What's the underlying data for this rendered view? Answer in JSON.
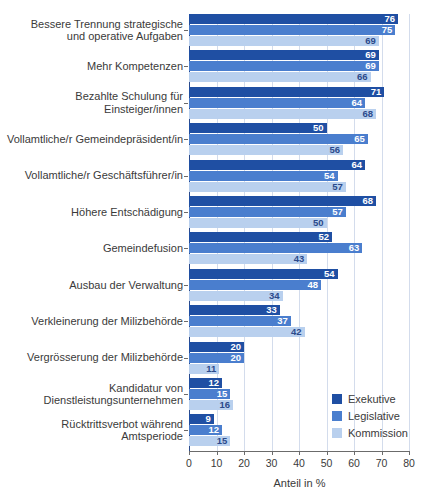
{
  "chart_data": {
    "type": "bar",
    "orientation": "horizontal",
    "title": "",
    "xlabel": "Anteil in %",
    "ylabel": "",
    "xlim": [
      0,
      80
    ],
    "xticks": [
      0,
      10,
      20,
      30,
      40,
      50,
      60,
      70,
      80
    ],
    "grid": true,
    "legend_position": "bottom-right",
    "categories": [
      "Bessere Trennung strategische und operative Aufgaben",
      "Mehr Kompetenzen",
      "Bezahlte Schulung für Einsteiger/innen",
      "Vollamtliche/r Gemeindepräsident/in",
      "Vollamtliche/r Geschäftsführer/in",
      "Höhere Entschädigung",
      "Gemeindefusion",
      "Ausbau der Verwaltung",
      "Verkleinerung der Milizbehörde",
      "Vergrösserung der Milizbehörde",
      "Kandidatur von Dienstleistungsunternehmen",
      "Rücktrittsverbot während Amtsperiode"
    ],
    "category_lines": [
      [
        "Bessere Trennung strategische",
        "und operative Aufgaben"
      ],
      [
        "Mehr Kompetenzen"
      ],
      [
        "Bezahlte Schulung für",
        "Einsteiger/innen"
      ],
      [
        "Vollamtliche/r Gemeindepräsident/in"
      ],
      [
        "Vollamtliche/r Geschäftsführer/in"
      ],
      [
        "Höhere Entschädigung"
      ],
      [
        "Gemeindefusion"
      ],
      [
        "Ausbau der Verwaltung"
      ],
      [
        "Verkleinerung der Milizbehörde"
      ],
      [
        "Vergrösserung der Milizbehörde"
      ],
      [
        "Kandidatur von",
        "Dienstleistungsunternehmen"
      ],
      [
        "Rücktrittsverbot während",
        "Amtsperiode"
      ]
    ],
    "series": [
      {
        "name": "Exekutive",
        "color": "#1f4fa3",
        "values": [
          76,
          69,
          71,
          50,
          64,
          68,
          52,
          54,
          33,
          20,
          12,
          9
        ]
      },
      {
        "name": "Legislative",
        "color": "#4a7ece",
        "values": [
          75,
          69,
          64,
          65,
          54,
          57,
          63,
          48,
          37,
          20,
          15,
          12
        ]
      },
      {
        "name": "Kommission",
        "color": "#b9d0ee",
        "values": [
          69,
          66,
          68,
          56,
          57,
          50,
          43,
          34,
          42,
          11,
          16,
          15
        ]
      }
    ]
  },
  "axis": {
    "x_title": "Anteil in %",
    "tick_labels": [
      "0",
      "10",
      "20",
      "30",
      "40",
      "50",
      "60",
      "70",
      "80"
    ]
  },
  "legend": {
    "items": [
      {
        "label": "Exekutive",
        "color": "#1f4fa3"
      },
      {
        "label": "Legislative",
        "color": "#4a7ece"
      },
      {
        "label": "Kommission",
        "color": "#b9d0ee"
      }
    ]
  },
  "colors": {
    "exekutive": "#1f4fa3",
    "legislative": "#4a7ece",
    "kommission": "#b9d0ee",
    "grid": "#d3dcec",
    "axis": "#6b6b6b",
    "text": "#3a3a3a"
  }
}
